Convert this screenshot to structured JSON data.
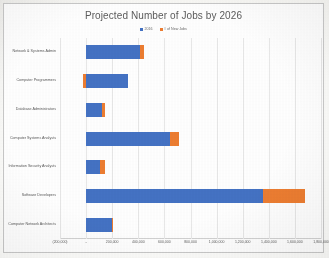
{
  "document": {
    "kind": "scanned-chart-page"
  },
  "chart": {
    "title": "Projected Number of Jobs by 2026",
    "legend": [
      {
        "label": "2016",
        "color": "#4472c4",
        "swatch_name": "legend-swatch-2016"
      },
      {
        "label": "# of New Jobs",
        "color": "#ed7d31",
        "swatch_name": "legend-swatch-new-jobs"
      }
    ]
  },
  "chart_data": {
    "type": "bar",
    "orientation": "horizontal",
    "stacked": true,
    "title": "Projected Number of Jobs by 2026",
    "xlabel": "",
    "ylabel": "",
    "xlim": [
      -200000,
      1800000
    ],
    "grid": true,
    "legend_position": "top",
    "categories": [
      "Network & Systems Admin",
      "Computer Programmers",
      "Database Administrators",
      "Computer Systems Analysts",
      "Information Security Analysts",
      "Software Developers",
      "Computer Network Architects"
    ],
    "series": [
      {
        "name": "2016",
        "color": "#4472c4",
        "values": [
          410000,
          320000,
          120000,
          640000,
          110000,
          1355000,
          200000
        ]
      },
      {
        "name": "# of New Jobs",
        "color": "#ed7d31",
        "values": [
          30000,
          -20000,
          25000,
          75000,
          35000,
          325000,
          5000
        ]
      }
    ],
    "xticks": [
      {
        "value": -200000,
        "label": "(200,000)"
      },
      {
        "value": 0,
        "label": "-"
      },
      {
        "value": 200000,
        "label": "200,000"
      },
      {
        "value": 400000,
        "label": "400,000"
      },
      {
        "value": 600000,
        "label": "600,000"
      },
      {
        "value": 800000,
        "label": "800,000"
      },
      {
        "value": 1000000,
        "label": "1,000,000"
      },
      {
        "value": 1200000,
        "label": "1,200,000"
      },
      {
        "value": 1400000,
        "label": "1,400,000"
      },
      {
        "value": 1600000,
        "label": "1,600,000"
      },
      {
        "value": 1800000,
        "label": "1,800,000"
      }
    ]
  }
}
